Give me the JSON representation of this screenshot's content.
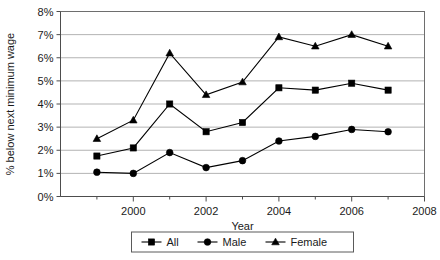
{
  "chart_data": {
    "type": "line",
    "title": "",
    "xlabel": "Year",
    "ylabel": "% below next minimum wage",
    "x": [
      1999,
      2000,
      2001,
      2002,
      2003,
      2004,
      2005,
      2006,
      2007
    ],
    "xlim": [
      1998,
      2008
    ],
    "ylim": [
      0,
      8
    ],
    "ytick_labels": [
      "0%",
      "1%",
      "2%",
      "3%",
      "4%",
      "5%",
      "6%",
      "7%",
      "8%"
    ],
    "ytick_values": [
      0,
      1,
      2,
      3,
      4,
      5,
      6,
      7,
      8
    ],
    "xtick_labels": [
      "2000",
      "2002",
      "2004",
      "2006",
      "2008"
    ],
    "xtick_values": [
      2000,
      2002,
      2004,
      2006,
      2008
    ],
    "xminor_ticks": [
      1999,
      2001,
      2003,
      2005,
      2007
    ],
    "grid": "horizontal",
    "legend_position": "bottom",
    "series": [
      {
        "name": "All",
        "marker": "square",
        "color": "#000000",
        "values": [
          1.75,
          2.1,
          4.0,
          2.8,
          3.2,
          4.7,
          4.6,
          4.9,
          4.6
        ]
      },
      {
        "name": "Male",
        "marker": "circle",
        "color": "#000000",
        "values": [
          1.05,
          1.0,
          1.9,
          1.25,
          1.55,
          2.4,
          2.6,
          2.9,
          2.8
        ]
      },
      {
        "name": "Female",
        "marker": "triangle",
        "color": "#000000",
        "values": [
          2.5,
          3.3,
          6.2,
          4.4,
          4.95,
          6.9,
          6.5,
          7.0,
          6.5
        ]
      }
    ]
  },
  "legend": {
    "items": [
      {
        "label": "All"
      },
      {
        "label": "Male"
      },
      {
        "label": "Female"
      }
    ]
  },
  "axes": {
    "x_title": "Year",
    "y_title": "% below next minimum wage"
  }
}
